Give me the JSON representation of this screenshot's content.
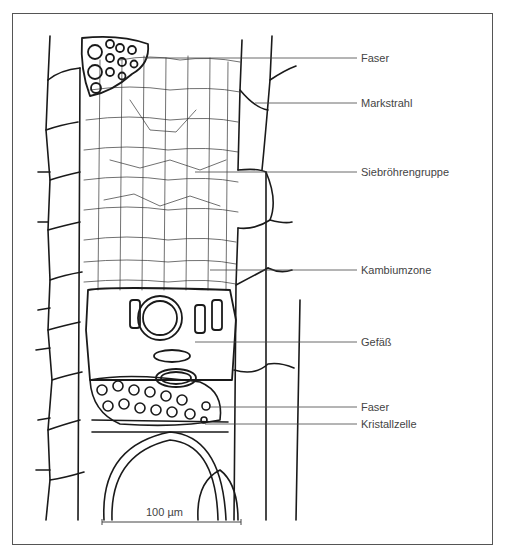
{
  "figure": {
    "labels": [
      {
        "id": "faser-top",
        "text": "Faser",
        "y": 58
      },
      {
        "id": "markstrahl",
        "text": "Markstrahl",
        "y": 103
      },
      {
        "id": "siebroehrengruppe",
        "text": "Siebröhrengruppe",
        "y": 172
      },
      {
        "id": "kambiumzone",
        "text": "Kambiumzone",
        "y": 270
      },
      {
        "id": "gefaess",
        "text": "Gefäß",
        "y": 342
      },
      {
        "id": "faser-bottom",
        "text": "Faser",
        "y": 407
      },
      {
        "id": "kristallzelle",
        "text": "Kristallzelle",
        "y": 424
      }
    ],
    "scale_bar": {
      "label": "100 µm"
    },
    "colors": {
      "ink": "#1a1a1a",
      "label": "#444444",
      "frame": "#555555"
    }
  }
}
